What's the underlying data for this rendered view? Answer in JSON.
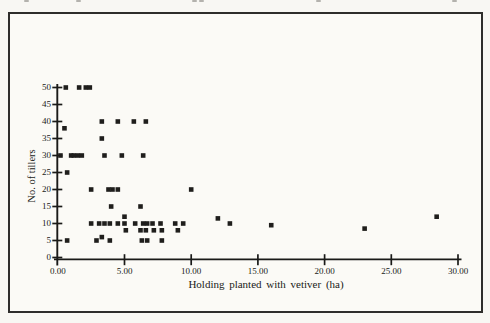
{
  "figure": {
    "background_color": "#f8f7f3",
    "frame_color": "#2e2d2b",
    "ink_color": "#1a1a18",
    "marker_color": "#1f1e1c"
  },
  "scan_artifacts": {
    "top_marks_x": [
      24,
      76,
      192,
      199,
      316,
      452
    ]
  },
  "chart_data": {
    "type": "scatter",
    "title": "",
    "xlabel": "Holding planted with vetiver (ha)",
    "ylabel": "No. of tillers",
    "marker": "filled-square",
    "grid": false,
    "legend": null,
    "xlim": [
      0,
      30
    ],
    "ylim": [
      0,
      50
    ],
    "x_tick_values": [
      0,
      5,
      10,
      15,
      20,
      25,
      30
    ],
    "x_tick_labels": [
      "0.00",
      "5.00",
      "10.00",
      "15.00",
      "20.00",
      "25.00",
      "30.00"
    ],
    "y_tick_values": [
      0,
      5,
      10,
      15,
      20,
      25,
      30,
      35,
      40,
      45,
      50
    ],
    "y_tick_labels": [
      "0",
      "5",
      "10",
      "15",
      "20",
      "25",
      "30",
      "35",
      "40",
      "45",
      "50"
    ],
    "points": [
      [
        0.6,
        50
      ],
      [
        1.6,
        50
      ],
      [
        2.1,
        50
      ],
      [
        2.4,
        50
      ],
      [
        3.3,
        40
      ],
      [
        4.5,
        40
      ],
      [
        5.7,
        40
      ],
      [
        6.6,
        40
      ],
      [
        0.5,
        38
      ],
      [
        3.3,
        35
      ],
      [
        0.2,
        30
      ],
      [
        1.0,
        30
      ],
      [
        1.2,
        30
      ],
      [
        1.5,
        30
      ],
      [
        1.8,
        30
      ],
      [
        3.5,
        30
      ],
      [
        4.8,
        30
      ],
      [
        6.4,
        30
      ],
      [
        0.7,
        25
      ],
      [
        2.5,
        20
      ],
      [
        3.8,
        20
      ],
      [
        4.1,
        20
      ],
      [
        4.5,
        20
      ],
      [
        10.0,
        20
      ],
      [
        4.0,
        15
      ],
      [
        6.2,
        15
      ],
      [
        5.0,
        12
      ],
      [
        28.4,
        12
      ],
      [
        12.0,
        11.5
      ],
      [
        2.5,
        10
      ],
      [
        3.1,
        10
      ],
      [
        3.5,
        10
      ],
      [
        3.9,
        10
      ],
      [
        4.5,
        10
      ],
      [
        5.0,
        10
      ],
      [
        5.8,
        10
      ],
      [
        6.4,
        10
      ],
      [
        6.7,
        10
      ],
      [
        7.1,
        10
      ],
      [
        7.7,
        10
      ],
      [
        8.8,
        10
      ],
      [
        9.4,
        10
      ],
      [
        12.9,
        10
      ],
      [
        16.0,
        9.5
      ],
      [
        5.1,
        8
      ],
      [
        6.2,
        8
      ],
      [
        6.6,
        8
      ],
      [
        7.2,
        8
      ],
      [
        7.8,
        8
      ],
      [
        9.0,
        8
      ],
      [
        23.0,
        8.5
      ],
      [
        3.3,
        6
      ],
      [
        0.7,
        5
      ],
      [
        2.9,
        5
      ],
      [
        3.9,
        5
      ],
      [
        6.3,
        5
      ],
      [
        6.7,
        5
      ],
      [
        7.8,
        5
      ]
    ]
  }
}
